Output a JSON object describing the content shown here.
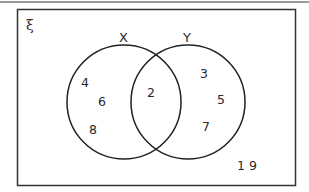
{
  "diagram": {
    "type": "venn",
    "universal_symbol": "ξ",
    "sets": [
      {
        "name": "X",
        "label": "X"
      },
      {
        "name": "Y",
        "label": "Y"
      }
    ],
    "regions": {
      "x_only": [
        "4",
        "6",
        "8"
      ],
      "intersection": [
        "2"
      ],
      "y_only": [
        "3",
        "5",
        "7"
      ],
      "outside": "1 9"
    },
    "colors": {
      "stroke": "#222222",
      "text": "#2a2a2a",
      "background": "#ffffff",
      "top_rule": "#9a9a9a"
    }
  }
}
